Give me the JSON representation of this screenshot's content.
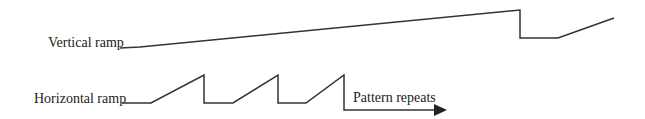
{
  "diagram": {
    "vertical_ramp": {
      "label": "Vertical ramp",
      "waveform_points": "120,48 140,47 520,10 520,38 558,38 614,18"
    },
    "horizontal_ramp": {
      "label": "Horizontal ramp",
      "waveform_points": "122,103 151,103 204,75 204,103 233,103 278,75 278,103 306,103 344,75 344,110 440,110"
    },
    "annotation": {
      "label": "Pattern repeats"
    },
    "colors": {
      "line": "#333333",
      "text": "#222222",
      "background": "#ffffff"
    }
  }
}
